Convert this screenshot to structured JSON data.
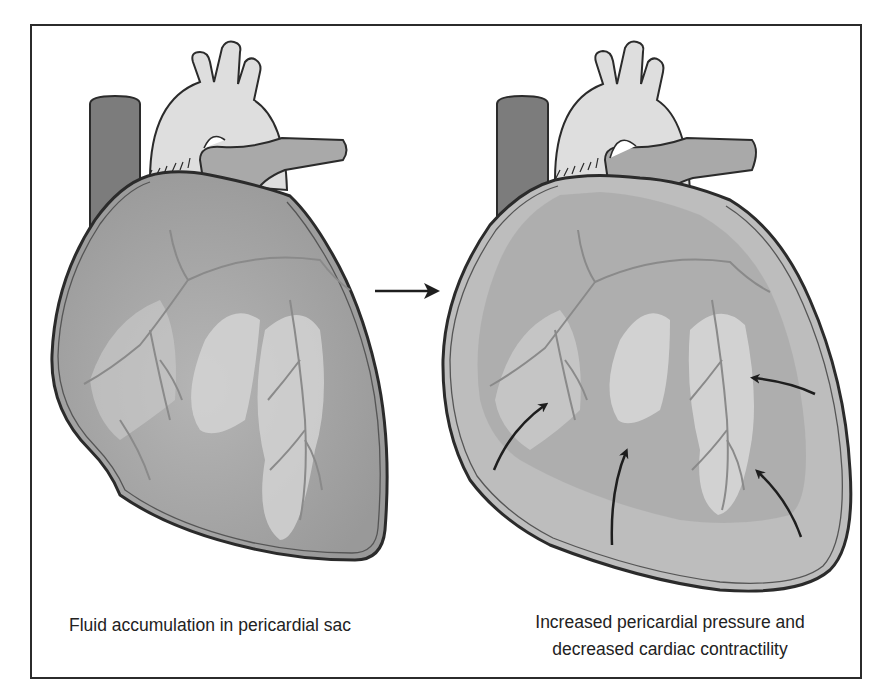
{
  "figure": {
    "panels": [
      {
        "id": "left",
        "caption": "Fluid accumulation in pericardial sac",
        "description": "Heart with fluid accumulating in the pericardial sac"
      },
      {
        "id": "right",
        "caption_lines": [
          "Increased pericardial pressure and",
          "decreased cardiac contractility"
        ],
        "description": "Enlarged pericardial sac compressing the heart",
        "pressure_arrow_count": 5
      }
    ],
    "transition_arrow": "right-arrow",
    "colors": {
      "outline": "#2b2b2b",
      "vessel_dark": "#7c7c7c",
      "vessel_light": "#dedede",
      "heart_mid": "#a9a9a9",
      "heart_light": "#d2d2d2",
      "heart_dark": "#9b9b9b",
      "fluid": "#bdbdbd",
      "background": "#ffffff"
    }
  }
}
